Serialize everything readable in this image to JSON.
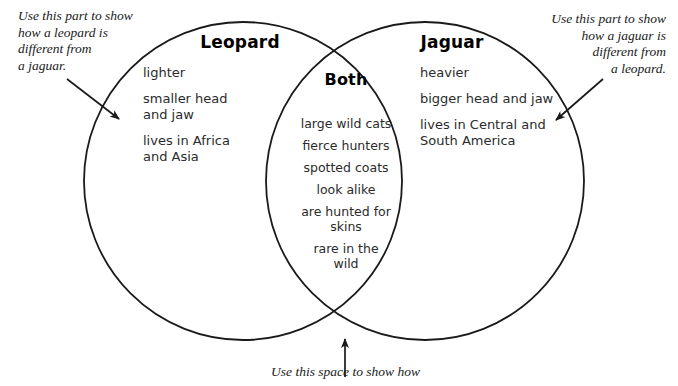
{
  "diagram": {
    "type": "venn-diagram",
    "stroke_color": "#1a1a1a",
    "background_color": "#ffffff",
    "left_circle": {
      "label": "Leopard"
    },
    "right_circle": {
      "label": "Jaguar"
    },
    "intersection": {
      "label": "Both"
    }
  },
  "leopard": {
    "title": "Leopard",
    "items": [
      "lighter",
      "smaller head\nand jaw",
      "lives in Africa\nand Asia"
    ]
  },
  "jaguar": {
    "title": "Jaguar",
    "items": [
      "heavier",
      "bigger head and jaw",
      "lives in Central and\nSouth America"
    ]
  },
  "both": {
    "title": "Both",
    "items": [
      "large wild cats",
      "fierce hunters",
      "spotted coats",
      "look alike",
      "are hunted for\nskins",
      "rare in the\nwild"
    ]
  },
  "annotations": {
    "left": "Use this part to show\nhow a leopard is\ndifferent from\na jaguar.",
    "right": "Use this part to show\nhow a jaguar is\ndifferent from\na leopard.",
    "bottom": "Use this space to show how"
  },
  "arrows": [
    {
      "name": "left-annotation-arrow",
      "direction": "down-right"
    },
    {
      "name": "right-annotation-arrow",
      "direction": "down-left"
    },
    {
      "name": "bottom-annotation-arrow",
      "direction": "up"
    }
  ]
}
